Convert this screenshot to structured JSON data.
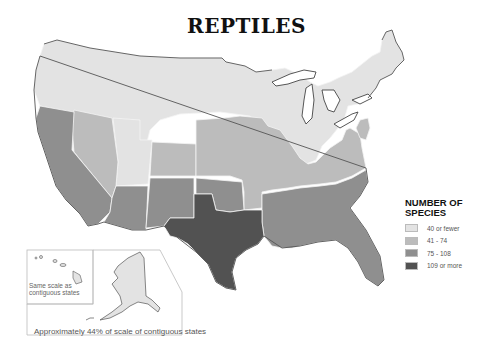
{
  "title": "REPTILES",
  "legend": {
    "title_line1": "NUMBER OF",
    "title_line2": "SPECIES",
    "items": [
      {
        "label": "40 or fewer",
        "color": "#e3e3e3"
      },
      {
        "label": "41 - 74",
        "color": "#bcbcbc"
      },
      {
        "label": "75 - 108",
        "color": "#8f8f8f"
      },
      {
        "label": "109 or more",
        "color": "#525252"
      }
    ]
  },
  "insets": {
    "hawaii_note_line1": "Same scale as",
    "hawaii_note_line2": "contiguous states",
    "alaska_caption": "Approximately 44% of scale of contiguous states"
  },
  "colors": {
    "c1": "#e3e3e3",
    "c2": "#bcbcbc",
    "c3": "#8f8f8f",
    "c4": "#525252"
  },
  "map_categories": {
    "40_or_fewer": [
      "Washington",
      "Oregon",
      "Idaho",
      "Montana",
      "Wyoming",
      "Utah",
      "North Dakota",
      "South Dakota",
      "Minnesota",
      "Wisconsin",
      "Michigan",
      "Ohio",
      "Pennsylvania",
      "New York",
      "Vermont",
      "New Hampshire",
      "Maine",
      "Massachusetts",
      "Connecticut",
      "Rhode Island",
      "West Virginia",
      "Alaska",
      "Hawaii"
    ],
    "41_74": [
      "Nevada",
      "Colorado",
      "Nebraska",
      "Iowa",
      "Kansas",
      "Missouri",
      "Illinois",
      "Indiana",
      "Kentucky",
      "Tennessee",
      "Virginia",
      "Arkansas",
      "New Jersey",
      "Delaware",
      "Maryland"
    ],
    "75_108": [
      "California",
      "Arizona",
      "New Mexico",
      "Oklahoma",
      "Louisiana",
      "Mississippi",
      "Alabama",
      "Georgia",
      "South Carolina",
      "North Carolina",
      "Florida"
    ],
    "109_or_more": [
      "Texas"
    ]
  }
}
